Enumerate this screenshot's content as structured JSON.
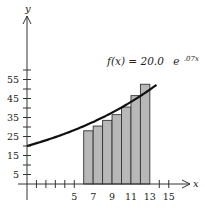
{
  "chart_data": {
    "type": "bar",
    "title": "",
    "xlabel": "x",
    "ylabel": "y",
    "function_label": {
      "prefix": "f(x) = 20.0",
      "base": "e",
      "exponent": ".07x"
    },
    "function": {
      "a": 20.0,
      "k": 0.07
    },
    "x_ticks": [
      5,
      7,
      9,
      11,
      13,
      15
    ],
    "y_ticks": [
      5,
      15,
      25,
      35,
      45,
      55
    ],
    "xlim": [
      0,
      16
    ],
    "ylim": [
      0,
      65
    ],
    "bars": {
      "x_edges": [
        6,
        7,
        8,
        9,
        10,
        11,
        12,
        13
      ],
      "heights": [
        28,
        30.5,
        33.5,
        36.5,
        40.5,
        46.5,
        52.5
      ]
    },
    "curve_range": [
      0,
      13.7
    ],
    "grid": false,
    "legend": null,
    "colors": {
      "bar_fill": "#b8b8b8",
      "bar_stroke": "#333333",
      "curve": "#111111",
      "axis": "#333333"
    }
  },
  "labels": {
    "x_axis": "x",
    "y_axis": "y",
    "formula_prefix": "f(x) = 20.0",
    "formula_base": "e",
    "formula_exp": ".07x",
    "x_tick_labels": [
      "5",
      "7",
      "9",
      "11",
      "13",
      "15"
    ],
    "y_tick_labels": [
      "5",
      "15",
      "25",
      "35",
      "45",
      "55"
    ]
  }
}
